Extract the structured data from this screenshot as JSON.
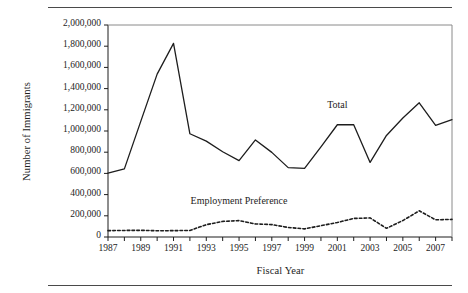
{
  "figure": {
    "background": "#ffffff",
    "ink_color": "#1d1d1d",
    "rule_color": "#4a4a4a"
  },
  "chart_data": {
    "type": "line",
    "title": "",
    "xlabel": "Fiscal Year",
    "ylabel": "Number of Immigrants",
    "xlim": [
      1987,
      2008
    ],
    "ylim": [
      0,
      2000000
    ],
    "grid": false,
    "legend_position": "inline-labels",
    "x": [
      1987,
      1988,
      1989,
      1990,
      1991,
      1992,
      1993,
      1994,
      1995,
      1996,
      1997,
      1998,
      1999,
      2000,
      2001,
      2002,
      2003,
      2004,
      2005,
      2006,
      2007,
      2008
    ],
    "ytick_labels": [
      "0",
      "200,000",
      "400,000",
      "600,000",
      "800,000",
      "1,000,000",
      "1,200,000",
      "1,400,000",
      "1,600,000",
      "1,800,000",
      "2,000,000"
    ],
    "ytick_values": [
      0,
      200000,
      400000,
      600000,
      800000,
      1000000,
      1200000,
      1400000,
      1600000,
      1800000,
      2000000
    ],
    "xtick_labels": [
      "1987",
      "1989",
      "1991",
      "1993",
      "1995",
      "1997",
      "1999",
      "2001",
      "2003",
      "2005",
      "2007"
    ],
    "xtick_values": [
      1987,
      1989,
      1991,
      1993,
      1995,
      1997,
      1999,
      2001,
      2003,
      2005,
      2007
    ],
    "xminor_values": [
      1988,
      1990,
      1992,
      1994,
      1996,
      1998,
      2000,
      2002,
      2004,
      2006,
      2008
    ],
    "series": [
      {
        "name": "Total",
        "style": "solid",
        "color": "#1d1d1d",
        "label_text": "Total",
        "values": [
          601516,
          643025,
          1090924,
          1536483,
          1827167,
          973977,
          904292,
          804416,
          720461,
          915900,
          798378,
          654451,
          646568,
          849807,
          1058902,
          1059356,
          703542,
          957883,
          1122373,
          1266264,
          1052415,
          1107126
        ]
      },
      {
        "name": "Employment Preference",
        "style": "dashed",
        "color": "#1d1d1d",
        "label_text": "Employment Preference",
        "values": [
          60000,
          62000,
          63000,
          59000,
          60000,
          62000,
          116000,
          147000,
          155000,
          123000,
          117000,
          90000,
          77000,
          107000,
          137000,
          175000,
          180000,
          82000,
          155000,
          247000,
          162000,
          166000
        ]
      }
    ],
    "annotations": [
      {
        "text": "Total",
        "x": 2001,
        "y": 1240000
      },
      {
        "text": "Employment Preference",
        "x": 1995,
        "y": 330000
      }
    ]
  }
}
